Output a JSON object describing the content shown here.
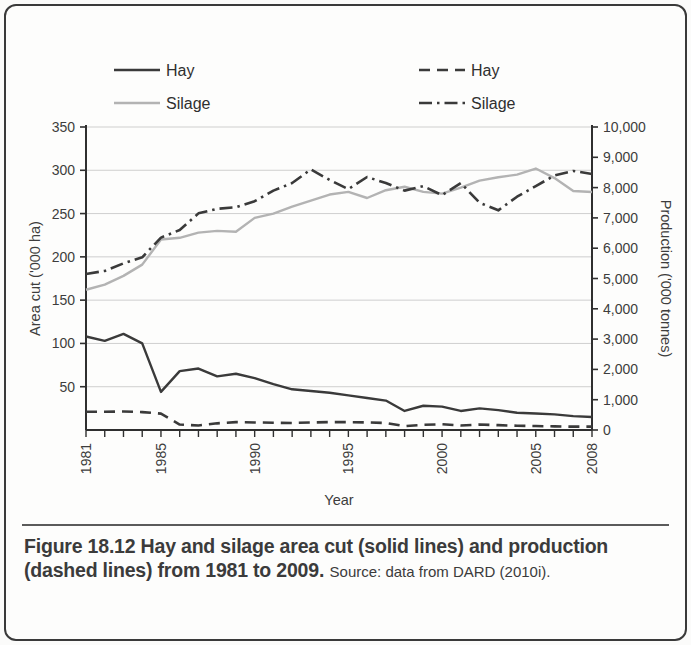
{
  "figure": {
    "caption_bold": "Figure 18.12 Hay and silage area cut (solid lines) and production (dashed lines) from 1981 to 2009.",
    "caption_source": "Source: data from DARD (2010i)."
  },
  "legend": {
    "left": [
      {
        "label": "Hay",
        "style": "solid",
        "color": "#3a3a3a"
      },
      {
        "label": "Silage",
        "style": "solid",
        "color": "#b3b3b3"
      }
    ],
    "right": [
      {
        "label": "Hay",
        "style": "dashed",
        "color": "#3a3a3a"
      },
      {
        "label": "Silage",
        "style": "dashdot",
        "color": "#3a3a3a"
      }
    ]
  },
  "chart_data": {
    "type": "line",
    "title": "",
    "xlabel": "Year",
    "ylabel": "Area cut ('000 ha)",
    "y2label": "Production ('000 tonnes)",
    "xlim": [
      1981,
      2008
    ],
    "ylim": [
      0,
      350
    ],
    "y2lim": [
      0,
      10000
    ],
    "grid": true,
    "legend_position": "top",
    "x_tick_labels": [
      "1981",
      "1985",
      "1990",
      "1995",
      "2000",
      "2005",
      "2008"
    ],
    "x_tick_values": [
      1981,
      1985,
      1990,
      1995,
      2000,
      2005,
      2008
    ],
    "y_tick_labels": [
      "50",
      "100",
      "150",
      "200",
      "250",
      "300",
      "350"
    ],
    "y_tick_values": [
      50,
      100,
      150,
      200,
      250,
      300,
      350
    ],
    "y2_tick_labels": [
      "0",
      "1,000",
      "2,000",
      "3,000",
      "4,000",
      "5,000",
      "6,000",
      "7,000",
      "8,000",
      "9,000",
      "10,000"
    ],
    "y2_tick_values": [
      0,
      1000,
      2000,
      3000,
      4000,
      5000,
      6000,
      7000,
      8000,
      9000,
      10000
    ],
    "x": [
      1981,
      1982,
      1983,
      1984,
      1985,
      1986,
      1987,
      1988,
      1989,
      1990,
      1991,
      1992,
      1993,
      1994,
      1995,
      1996,
      1997,
      1998,
      1999,
      2000,
      2001,
      2002,
      2003,
      2004,
      2005,
      2006,
      2007,
      2008
    ],
    "series": [
      {
        "name": "Hay",
        "axis": "left",
        "style": "solid",
        "color": "#3a3a3a",
        "unit": "'000 ha",
        "values": [
          108,
          103,
          111,
          100,
          44,
          68,
          71,
          62,
          65,
          60,
          53,
          47,
          45,
          43,
          40,
          37,
          34,
          22,
          28,
          27,
          22,
          25,
          23,
          20,
          19,
          18,
          16,
          15
        ]
      },
      {
        "name": "Silage",
        "axis": "left",
        "style": "solid",
        "color": "#b3b3b3",
        "unit": "'000 ha",
        "values": [
          162,
          168,
          178,
          191,
          220,
          222,
          228,
          230,
          229,
          245,
          250,
          258,
          265,
          272,
          275,
          268,
          277,
          281,
          275,
          273,
          280,
          288,
          292,
          295,
          302,
          291,
          276,
          275
        ]
      },
      {
        "name": "Hay",
        "axis": "right",
        "style": "dashed",
        "color": "#3a3a3a",
        "unit": "'000 tonnes",
        "values": [
          600,
          600,
          610,
          590,
          540,
          180,
          150,
          220,
          260,
          250,
          240,
          230,
          250,
          260,
          260,
          250,
          230,
          130,
          170,
          190,
          150,
          180,
          160,
          140,
          130,
          120,
          110,
          110
        ]
      },
      {
        "name": "Silage",
        "axis": "right",
        "style": "dashdot",
        "color": "#3a3a3a",
        "unit": "'000 tonnes",
        "values": [
          5150,
          5250,
          5500,
          5700,
          6350,
          6600,
          7150,
          7300,
          7350,
          7550,
          7900,
          8150,
          8600,
          8250,
          7950,
          8350,
          8150,
          7900,
          8050,
          7750,
          8150,
          7500,
          7250,
          7700,
          8050,
          8400,
          8550,
          8450
        ]
      }
    ]
  }
}
